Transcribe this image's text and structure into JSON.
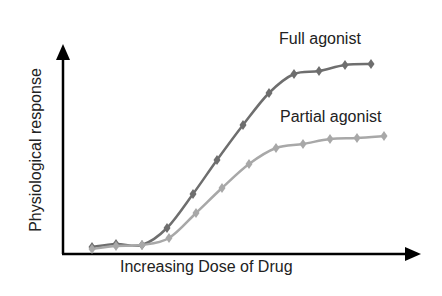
{
  "chart_data": {
    "type": "line",
    "title": "",
    "xlabel": "Increasing Dose of Drug",
    "ylabel": "Physiological response",
    "x": [
      1,
      2,
      3,
      4,
      5,
      6,
      7,
      8,
      9,
      10,
      11,
      12
    ],
    "xlim": [
      0,
      13
    ],
    "ylim": [
      0,
      100
    ],
    "grid": false,
    "legend": "inline labels",
    "series": [
      {
        "name": "Full agonist",
        "color": "#6e6e6e",
        "marker": "diamond",
        "values": [
          3,
          5,
          4,
          12,
          29,
          45,
          62,
          77,
          86,
          88,
          91,
          91
        ]
      },
      {
        "name": "Partial agonist",
        "color": "#a8a8a8",
        "marker": "diamond",
        "values": [
          2,
          4,
          4,
          8,
          20,
          32,
          43,
          51,
          53,
          55,
          56,
          57
        ]
      }
    ]
  },
  "labels": {
    "full": "Full agonist",
    "partial": "Partial agonist",
    "xlabel": "Increasing Dose of Drug",
    "ylabel": "Physiological response"
  },
  "pixel_points": {
    "full": [
      [
        92,
        247
      ],
      [
        116,
        244
      ],
      [
        142,
        245
      ],
      [
        167,
        228
      ],
      [
        193,
        194
      ],
      [
        217,
        160
      ],
      [
        243,
        125
      ],
      [
        269,
        93
      ],
      [
        294,
        74
      ],
      [
        319,
        71
      ],
      [
        345,
        65
      ],
      [
        371,
        64
      ]
    ],
    "partial": [
      [
        92,
        249
      ],
      [
        116,
        246
      ],
      [
        142,
        245
      ],
      [
        169,
        238
      ],
      [
        196,
        213
      ],
      [
        222,
        188
      ],
      [
        249,
        164
      ],
      [
        276,
        148
      ],
      [
        303,
        144
      ],
      [
        330,
        139
      ],
      [
        357,
        138
      ],
      [
        384,
        136
      ]
    ]
  }
}
